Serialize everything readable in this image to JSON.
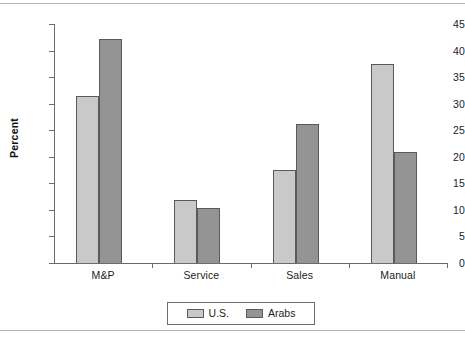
{
  "chart_data": {
    "type": "bar",
    "title": "",
    "subtitle": "",
    "xlabel": "",
    "ylabel": "Percent",
    "categories": [
      "M&P",
      "Service",
      "Sales",
      "Manual"
    ],
    "series": [
      {
        "name": "U.S.",
        "color": "#c9c9c9",
        "values": [
          31.4,
          11.9,
          17.6,
          37.4
        ]
      },
      {
        "name": "Arabs",
        "color": "#949494",
        "values": [
          42.1,
          10.4,
          26.1,
          20.9
        ]
      }
    ],
    "ylim": [
      0,
      45
    ],
    "ytick_values": [
      0,
      5,
      10,
      15,
      20,
      25,
      30,
      35,
      40,
      45
    ],
    "ytick_labels": [
      "0",
      "5",
      "10",
      "15",
      "20",
      "25",
      "30",
      "35",
      "40",
      "45"
    ],
    "grid": false,
    "legend_position": "bottom-center",
    "legend_entries": [
      "U.S.",
      "Arabs"
    ],
    "units": "percent"
  },
  "figure": {
    "axis_color": "#6b6b6b",
    "bar_edge_color": "#5a5a5a",
    "background": "#ffffff",
    "rule_color": "#b4b4b4"
  }
}
